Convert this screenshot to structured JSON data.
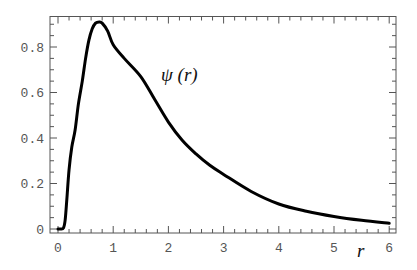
{
  "chart_data": {
    "type": "line",
    "title": "",
    "xlabel": "r",
    "ylabel": "",
    "xlim": [
      -0.15,
      6.15
    ],
    "ylim": [
      -0.018,
      0.93
    ],
    "grid": false,
    "legend": null,
    "x_ticks": [
      0,
      1,
      2,
      3,
      4,
      5,
      6
    ],
    "x_tick_labels": [
      "0",
      "1",
      "2",
      "3",
      "4",
      "5",
      "6"
    ],
    "y_ticks": [
      0,
      0.2,
      0.4,
      0.6,
      0.8
    ],
    "y_tick_labels": [
      "0",
      "0.2",
      "0.4",
      "0.6",
      "0.8"
    ],
    "annotations": [
      {
        "text": "ψ (r)",
        "x": 1.9,
        "y": 0.66
      }
    ],
    "series": [
      {
        "name": "ψ (r)",
        "color": "#000000",
        "x": [
          0.0,
          0.05,
          0.1,
          0.13,
          0.16,
          0.2,
          0.25,
          0.31,
          0.37,
          0.44,
          0.5,
          0.56,
          0.62,
          0.68,
          0.745,
          0.8,
          0.9,
          1.0,
          1.2,
          1.5,
          1.75,
          2.0,
          2.25,
          2.5,
          2.75,
          3.0,
          3.5,
          4.0,
          4.5,
          5.0,
          5.5,
          6.0
        ],
        "y": [
          0.0,
          0.0,
          0.005,
          0.04,
          0.13,
          0.26,
          0.36,
          0.435,
          0.55,
          0.65,
          0.75,
          0.83,
          0.88,
          0.905,
          0.91,
          0.905,
          0.87,
          0.81,
          0.75,
          0.67,
          0.57,
          0.47,
          0.39,
          0.33,
          0.28,
          0.24,
          0.165,
          0.11,
          0.078,
          0.055,
          0.038,
          0.025
        ]
      }
    ]
  },
  "labels": {
    "curve": "ψ (r)",
    "x_axis": "r"
  }
}
